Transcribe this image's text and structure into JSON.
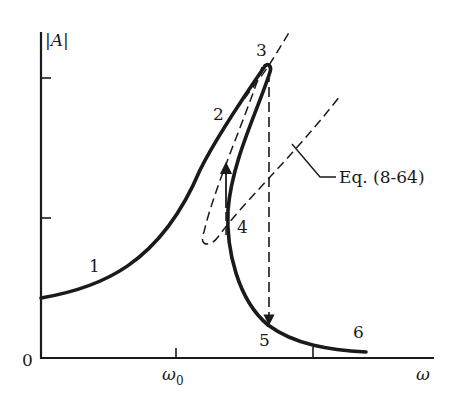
{
  "figure": {
    "type": "jump-phenomenon frequency response diagram",
    "colors": {
      "ink": "#1a1a1a",
      "background": "#ffffff"
    }
  },
  "axes": {
    "y_label": "|A|",
    "x_label": "ω",
    "origin_label": "0",
    "x_ticks": [
      {
        "label": "ω",
        "subscript": "0"
      },
      {
        "label": ""
      }
    ],
    "y_ticks": [
      {
        "label": ""
      },
      {
        "label": ""
      }
    ]
  },
  "points": [
    {
      "id": "1",
      "label": "1"
    },
    {
      "id": "2",
      "label": "2"
    },
    {
      "id": "3",
      "label": "3"
    },
    {
      "id": "4",
      "label": "4"
    },
    {
      "id": "5",
      "label": "5"
    },
    {
      "id": "6",
      "label": "6"
    }
  ],
  "annotations": {
    "backbone_equation": "Eq. (8-64)"
  },
  "curves": {
    "response": "solid heavy curve 1→2→3, unstable branch 3→4, lower branch 4→5→6",
    "backbone": "dashed line through peak 3",
    "equation_curve": "dashed curve labeled Eq. (8-64) with loop near 4",
    "jump_up": "arrow from 4 up to 2",
    "jump_down": "dashed arrow from 3 down to 5"
  }
}
